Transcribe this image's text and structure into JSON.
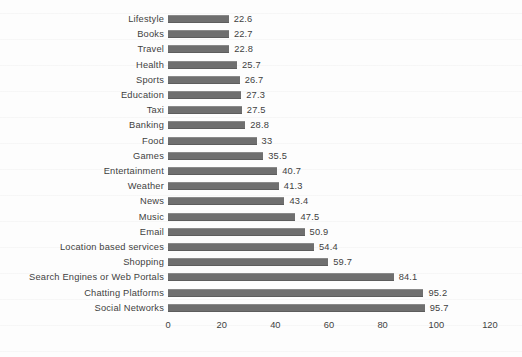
{
  "chart_data": {
    "type": "bar",
    "orientation": "horizontal",
    "title": "",
    "xlabel": "",
    "ylabel": "",
    "xlim": [
      0,
      120
    ],
    "xticks": [
      0,
      20,
      40,
      60,
      80,
      100,
      120
    ],
    "grid": false,
    "legend": null,
    "bar_color": "#6f6f6f",
    "text_color": "#3f3f3f",
    "background_color": "#fdfdfd",
    "categories": [
      "Lifestyle",
      "Books",
      "Travel",
      "Health",
      "Sports",
      "Education",
      "Taxi",
      "Banking",
      "Food",
      "Games",
      "Entertainment",
      "Weather",
      "News",
      "Music",
      "Email",
      "Location based services",
      "Shopping",
      "Search Engines or Web Portals",
      "Chatting Platforms",
      "Social Networks"
    ],
    "values": [
      22.6,
      22.7,
      22.8,
      25.7,
      26.7,
      27.3,
      27.5,
      28.8,
      33,
      35.5,
      40.7,
      41.3,
      43.4,
      47.5,
      50.9,
      54.4,
      59.7,
      84.1,
      95.2,
      95.7
    ],
    "value_labels": [
      "22.6",
      "22.7",
      "22.8",
      "25.7",
      "26.7",
      "27.3",
      "27.5",
      "28.8",
      "33",
      "35.5",
      "40.7",
      "41.3",
      "43.4",
      "47.5",
      "50.9",
      "54.4",
      "59.7",
      "84.1",
      "95.2",
      "95.7"
    ]
  },
  "axis": {
    "tick_labels": [
      "0",
      "20",
      "40",
      "60",
      "80",
      "100",
      "120"
    ]
  }
}
